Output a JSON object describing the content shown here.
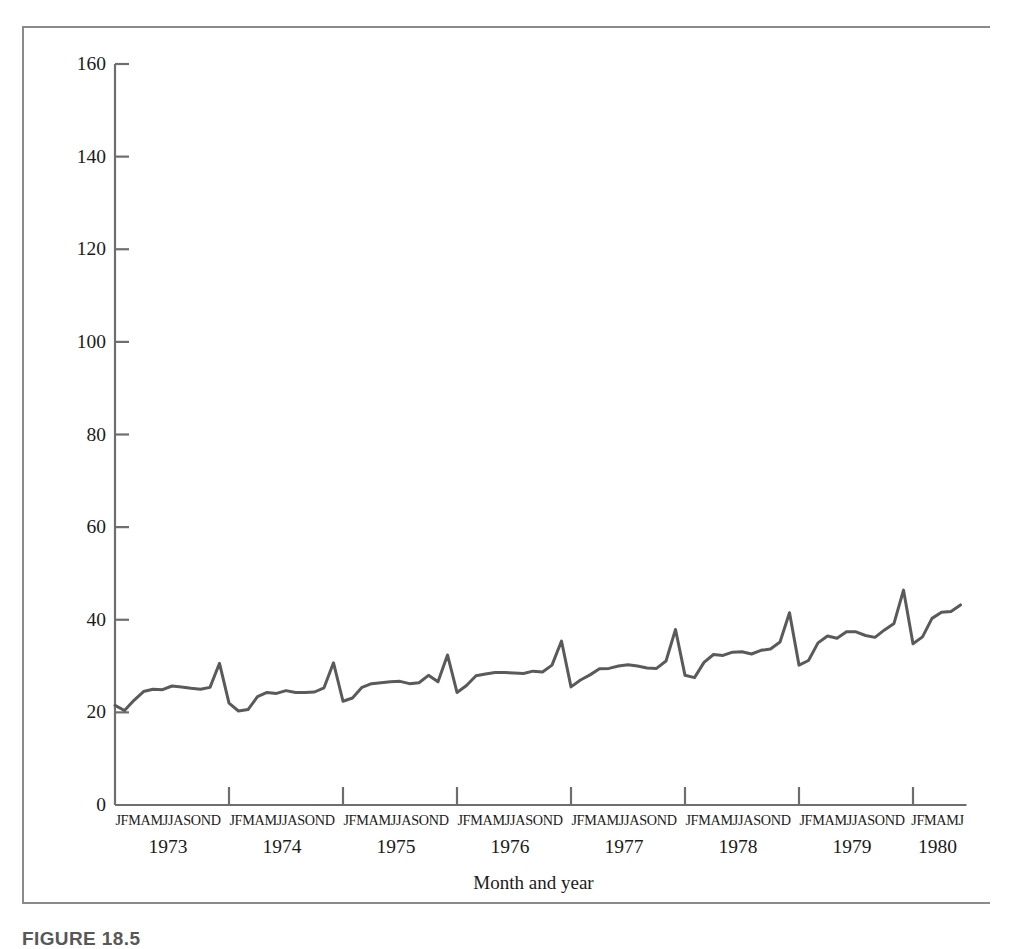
{
  "figure": {
    "caption": "FIGURE 18.5"
  },
  "chart_data": {
    "type": "line",
    "title": "",
    "xlabel": "Month and year",
    "ylabel": "Domestic retail sales ($ millions)",
    "ylim": [
      0,
      160
    ],
    "yticks": [
      0,
      20,
      40,
      60,
      80,
      100,
      120,
      140,
      160
    ],
    "ytick_labels": [
      "0",
      "20",
      "40",
      "60",
      "80",
      "100",
      "120",
      "140",
      "160"
    ],
    "grid": false,
    "legend": "none",
    "line_color": "#5a5a5a",
    "line_width": 3,
    "month_letters": [
      "J",
      "F",
      "M",
      "A",
      "M",
      "J",
      "J",
      "A",
      "S",
      "O",
      "N",
      "D"
    ],
    "years": [
      "1973",
      "1974",
      "1975",
      "1976",
      "1977",
      "1978",
      "1979",
      "1980"
    ],
    "year_month_counts": [
      12,
      12,
      12,
      12,
      12,
      12,
      12,
      6
    ],
    "x_tick_years": [
      "1973",
      "1974",
      "1975",
      "1976",
      "1977",
      "1978",
      "1979",
      "1980"
    ],
    "x": [
      "1973-01",
      "1973-02",
      "1973-03",
      "1973-04",
      "1973-05",
      "1973-06",
      "1973-07",
      "1973-08",
      "1973-09",
      "1973-10",
      "1973-11",
      "1973-12",
      "1974-01",
      "1974-02",
      "1974-03",
      "1974-04",
      "1974-05",
      "1974-06",
      "1974-07",
      "1974-08",
      "1974-09",
      "1974-10",
      "1974-11",
      "1974-12",
      "1975-01",
      "1975-02",
      "1975-03",
      "1975-04",
      "1975-05",
      "1975-06",
      "1975-07",
      "1975-08",
      "1975-09",
      "1975-10",
      "1975-11",
      "1975-12",
      "1976-01",
      "1976-02",
      "1976-03",
      "1976-04",
      "1976-05",
      "1976-06",
      "1976-07",
      "1976-08",
      "1976-09",
      "1976-10",
      "1976-11",
      "1976-12",
      "1977-01",
      "1977-02",
      "1977-03",
      "1977-04",
      "1977-05",
      "1977-06",
      "1977-07",
      "1977-08",
      "1977-09",
      "1977-10",
      "1977-11",
      "1977-12",
      "1978-01",
      "1978-02",
      "1978-03",
      "1978-04",
      "1978-05",
      "1978-06",
      "1978-07",
      "1978-08",
      "1978-09",
      "1978-10",
      "1978-11",
      "1978-12",
      "1979-01",
      "1979-02",
      "1979-03",
      "1979-04",
      "1979-05",
      "1979-06",
      "1979-07",
      "1979-08",
      "1979-09",
      "1979-10",
      "1979-11",
      "1979-12",
      "1980-01",
      "1980-02",
      "1980-03",
      "1980-04",
      "1980-05",
      "1980-06"
    ],
    "values": [
      21.5,
      20.4,
      22.6,
      24.5,
      25.0,
      24.9,
      25.7,
      25.5,
      25.2,
      25.0,
      25.4,
      30.6,
      22.0,
      20.3,
      20.6,
      23.4,
      24.3,
      24.1,
      24.7,
      24.3,
      24.3,
      24.4,
      25.3,
      30.7,
      22.4,
      23.1,
      25.4,
      26.2,
      26.4,
      26.6,
      26.7,
      26.2,
      26.4,
      28.0,
      26.6,
      32.4,
      24.3,
      25.8,
      27.9,
      28.3,
      28.6,
      28.6,
      28.5,
      28.4,
      28.9,
      28.7,
      30.2,
      35.4,
      25.5,
      27.0,
      28.1,
      29.4,
      29.5,
      30.0,
      30.3,
      30.0,
      29.6,
      29.5,
      31.1,
      37.9,
      28.0,
      27.5,
      30.8,
      32.5,
      32.3,
      33.0,
      33.1,
      32.6,
      33.4,
      33.7,
      35.2,
      41.5,
      30.2,
      31.2,
      35.0,
      36.5,
      36.0,
      37.4,
      37.4,
      36.6,
      36.2,
      37.8,
      39.2,
      46.4,
      34.8,
      36.3,
      40.3,
      41.6,
      41.8,
      43.2
    ]
  }
}
